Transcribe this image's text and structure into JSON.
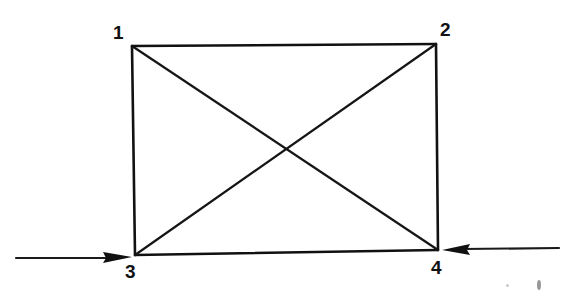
{
  "diagram": {
    "type": "truss-rectangle-with-diagonals",
    "nodes": [
      {
        "id": "1",
        "label": "1",
        "x": 132,
        "y": 46,
        "label_x": 113,
        "label_y": 23
      },
      {
        "id": "2",
        "label": "2",
        "x": 436,
        "y": 44,
        "label_x": 440,
        "label_y": 20
      },
      {
        "id": "3",
        "label": "3",
        "x": 135,
        "y": 255,
        "label_x": 125,
        "label_y": 262
      },
      {
        "id": "4",
        "label": "4",
        "x": 438,
        "y": 250,
        "label_x": 435,
        "label_y": 258
      }
    ],
    "edges": [
      {
        "from": "1",
        "to": "2",
        "kind": "side"
      },
      {
        "from": "2",
        "to": "4",
        "kind": "side"
      },
      {
        "from": "4",
        "to": "3",
        "kind": "side"
      },
      {
        "from": "3",
        "to": "1",
        "kind": "side"
      },
      {
        "from": "1",
        "to": "4",
        "kind": "diagonal"
      },
      {
        "from": "2",
        "to": "3",
        "kind": "diagonal"
      }
    ],
    "forces": [
      {
        "at": "3",
        "direction": "right",
        "from_x": 16,
        "to_x": 132,
        "y": 258
      },
      {
        "at": "4",
        "direction": "left",
        "from_x": 559,
        "to_x": 441,
        "y": 249
      }
    ],
    "colors": {
      "line": "#111111",
      "background": "#ffffff"
    }
  }
}
